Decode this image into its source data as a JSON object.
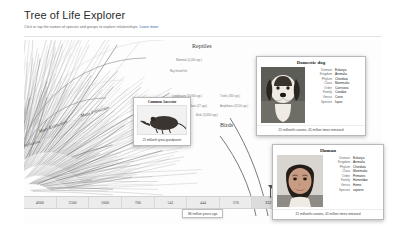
{
  "header": {
    "title": "Tree of Life Explorer",
    "subtitle": "Click or tap the names of species and groups to explore relationships.",
    "learn_more": "Learn more"
  },
  "tree": {
    "labels": [
      {
        "text": "Reptiles"
      },
      {
        "text": "Birds"
      },
      {
        "text": "Mass Extinction"
      },
      {
        "text": "Mass Extinction"
      },
      {
        "text": "Explosion"
      }
    ],
    "clades": [
      {
        "text": "Mammals (5,400 spp.)"
      },
      {
        "text": "Lepidosaurs (10,900 spp.)"
      },
      {
        "text": "Turtles (350 spp.)"
      },
      {
        "text": "Crocodilians (27 spp.)"
      },
      {
        "text": "Amphibians (8,100 spp.)"
      },
      {
        "text": "Birds (10,800 spp.)"
      },
      {
        "text": "Ray-finned fish"
      }
    ]
  },
  "timeline": {
    "ticks": [
      {
        "label": "4600",
        "active": false
      },
      {
        "label": "2500",
        "active": false
      },
      {
        "label": "1000",
        "active": false
      },
      {
        "label": "700",
        "active": false
      },
      {
        "label": "541",
        "active": false
      },
      {
        "label": "444",
        "active": false
      },
      {
        "label": "370",
        "active": false
      },
      {
        "label": "252",
        "active": true
      },
      {
        "label": "201",
        "active": false
      },
      {
        "label": "66",
        "active": false
      },
      {
        "label": "Today",
        "active": false
      }
    ],
    "tooltip": "86 million years ago"
  },
  "cards": {
    "ancestor": {
      "title": "Common Ancestor",
      "caption": "21 millionth great-grandparent",
      "photo_name": "shrew-like-ancestor-photo"
    },
    "dog": {
      "title": "Domestic dog",
      "photo_name": "domestic-dog-photo",
      "taxonomy": [
        {
          "rank": "Domain",
          "value": "Eukarya"
        },
        {
          "rank": "Kingdom",
          "value": "Animalia"
        },
        {
          "rank": "Phylum",
          "value": "Chordata"
        },
        {
          "rank": "Class",
          "value": "Mammalia"
        },
        {
          "rank": "Order",
          "value": "Carnivora"
        },
        {
          "rank": "Family",
          "value": "Canidae"
        },
        {
          "rank": "Genus",
          "value": "Canis"
        },
        {
          "rank": "Species",
          "value": "lupus"
        }
      ],
      "relation": "21 millionth cousins, 41 million times removed"
    },
    "human": {
      "title": "Human",
      "photo_name": "human-child-photo",
      "taxonomy": [
        {
          "rank": "Domain",
          "value": "Eukarya"
        },
        {
          "rank": "Kingdom",
          "value": "Animalia"
        },
        {
          "rank": "Phylum",
          "value": "Chordata"
        },
        {
          "rank": "Class",
          "value": "Mammalia"
        },
        {
          "rank": "Order",
          "value": "Primates"
        },
        {
          "rank": "Family",
          "value": "Hominidae"
        },
        {
          "rank": "Genus",
          "value": "Homo"
        },
        {
          "rank": "Species",
          "value": "sapiens"
        }
      ],
      "relation": "21 millionth cousins, 41 million times removed"
    }
  }
}
